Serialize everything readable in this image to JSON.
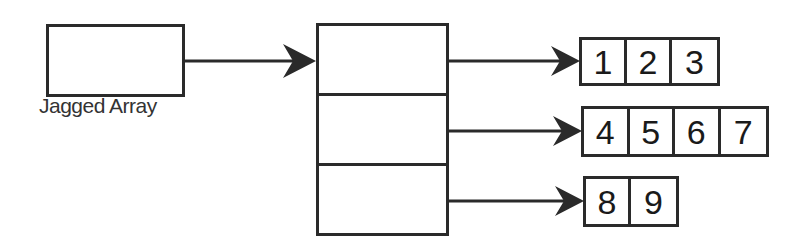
{
  "diagram": {
    "title_label": "Jagged Array",
    "colors": {
      "stroke": "#2a2a2a",
      "background": "#ffffff",
      "text": "#1a1a1a"
    },
    "reference_box": {
      "label": "Jagged Array"
    },
    "pointer_array": {
      "slots": 3
    },
    "rows": [
      {
        "index": 0,
        "values": [
          "1",
          "2",
          "3"
        ]
      },
      {
        "index": 1,
        "values": [
          "4",
          "5",
          "6",
          "7"
        ]
      },
      {
        "index": 2,
        "values": [
          "8",
          "9"
        ]
      }
    ],
    "arrows": [
      {
        "from": "reference_box",
        "to": "pointer_array"
      },
      {
        "from": "pointer_slot_0",
        "to": "row_0"
      },
      {
        "from": "pointer_slot_1",
        "to": "row_1"
      },
      {
        "from": "pointer_slot_2",
        "to": "row_2"
      }
    ]
  }
}
